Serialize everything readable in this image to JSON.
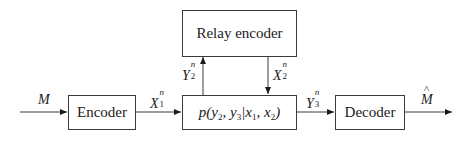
{
  "diagram": {
    "blocks": {
      "relay_encoder": "Relay encoder",
      "encoder": "Encoder",
      "channel": {
        "p": "p(",
        "y2": "y",
        "sub2": "2",
        "c1": ", ",
        "y3": "y",
        "sub3": "3",
        "bar": "|",
        "x1": "x",
        "subx1": "1",
        "c2": ", ",
        "x2": "x",
        "subx2": "2",
        "close": ")"
      },
      "decoder": "Decoder"
    },
    "signals": {
      "message_in": {
        "base": "M"
      },
      "x1n": {
        "base": "X",
        "sup": "n",
        "sub": "1"
      },
      "y2n": {
        "base": "Y",
        "sup": "n",
        "sub": "2"
      },
      "x2n": {
        "base": "X",
        "sup": "n",
        "sub": "2"
      },
      "y3n": {
        "base": "Y",
        "sup": "n",
        "sub": "3"
      },
      "message_out": {
        "base": "M",
        "accent": "hat"
      }
    },
    "colors": {
      "line": "#3a3a3a",
      "background": "#ffffff",
      "text": "#1a1a1a"
    }
  }
}
